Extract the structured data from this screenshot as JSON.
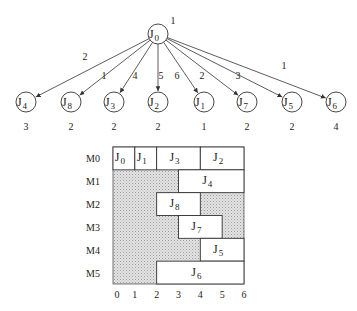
{
  "tree": {
    "root": {
      "id": "J0",
      "label": "J",
      "sub": "0",
      "weight": "1",
      "cx": 158,
      "cy": 34
    },
    "children": [
      {
        "id": "J4",
        "label": "J",
        "sub": "4",
        "edge_label": "2",
        "weight": "3",
        "cx": 26,
        "lx": 85,
        "ly": 60
      },
      {
        "id": "J8",
        "label": "J",
        "sub": "8",
        "edge_label": "1",
        "weight": "2",
        "cx": 71,
        "lx": 104,
        "ly": 79
      },
      {
        "id": "J3",
        "label": "J",
        "sub": "3",
        "edge_label": "4",
        "weight": "2",
        "cx": 114,
        "lx": 135,
        "ly": 79
      },
      {
        "id": "J2",
        "label": "J",
        "sub": "2",
        "edge_label": "5",
        "weight": "2",
        "cx": 158,
        "lx": 161,
        "ly": 79
      },
      {
        "id": "J1",
        "label": "J",
        "sub": "1",
        "edge_label": "6",
        "weight": "1",
        "cx": 204,
        "lx": 177,
        "ly": 79
      },
      {
        "id": "J7",
        "label": "J",
        "sub": "7",
        "edge_label": "2",
        "weight": "2",
        "cx": 247,
        "lx": 202,
        "ly": 79
      },
      {
        "id": "J5",
        "label": "J",
        "sub": "5",
        "edge_label": "3",
        "weight": "2",
        "cx": 292,
        "lx": 238,
        "ly": 79
      },
      {
        "id": "J6",
        "label": "J",
        "sub": "6",
        "edge_label": "1",
        "weight": "4",
        "cx": 336,
        "lx": 284,
        "ly": 69
      }
    ]
  },
  "gantt": {
    "machines": [
      "M0",
      "M1",
      "M2",
      "M3",
      "M4",
      "M5"
    ],
    "x_ticks": [
      "0",
      "1",
      "2",
      "3",
      "4",
      "5",
      "6"
    ],
    "tasks": [
      {
        "machine": 0,
        "id": "J0",
        "label": "J",
        "sub": "0",
        "start": 0,
        "end": 1
      },
      {
        "machine": 0,
        "id": "J1",
        "label": "J",
        "sub": "1",
        "start": 1,
        "end": 2
      },
      {
        "machine": 0,
        "id": "J3",
        "label": "J",
        "sub": "3",
        "start": 2,
        "end": 4
      },
      {
        "machine": 0,
        "id": "J2",
        "label": "J",
        "sub": "2",
        "start": 4,
        "end": 6
      },
      {
        "machine": 1,
        "id": "J4",
        "label": "J",
        "sub": "4",
        "start": 3,
        "end": 6
      },
      {
        "machine": 2,
        "id": "J8",
        "label": "J",
        "sub": "8",
        "start": 2,
        "end": 4
      },
      {
        "machine": 3,
        "id": "J7",
        "label": "J",
        "sub": "7",
        "start": 3,
        "end": 5
      },
      {
        "machine": 4,
        "id": "J5",
        "label": "J",
        "sub": "5",
        "start": 4,
        "end": 6
      },
      {
        "machine": 5,
        "id": "J6",
        "label": "J",
        "sub": "6",
        "start": 2,
        "end": 6
      }
    ],
    "idle_color": "#d8d8d8"
  }
}
